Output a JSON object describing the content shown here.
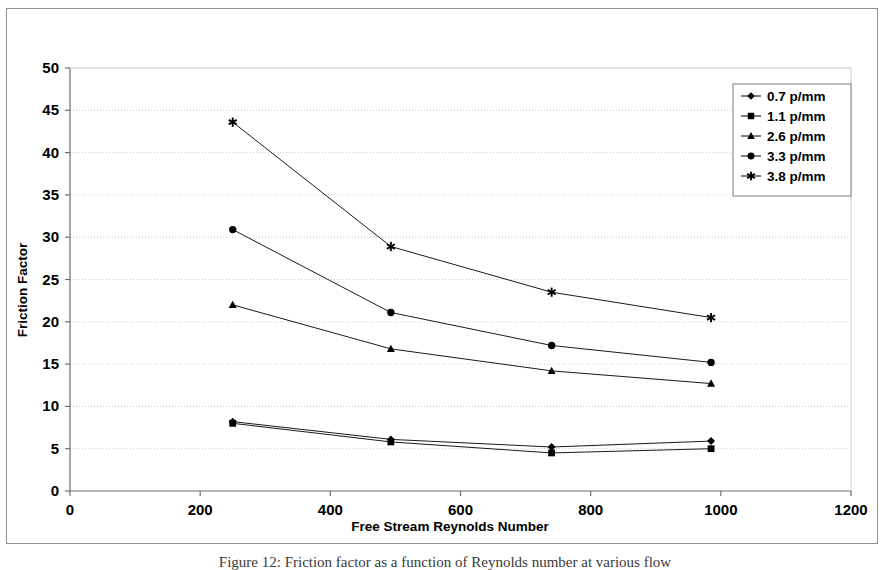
{
  "figure": {
    "caption": "Figure 12:  Friction factor as a function of Reynolds number at various flow"
  },
  "chart_data": {
    "type": "line",
    "title": "",
    "xlabel": "Free Stream Reynolds Number",
    "ylabel": "Friction Factor",
    "xlim": [
      0,
      1200
    ],
    "ylim": [
      0,
      50
    ],
    "xticks": [
      0,
      200,
      400,
      600,
      800,
      1000,
      1200
    ],
    "yticks": [
      0,
      5,
      10,
      15,
      20,
      25,
      30,
      35,
      40,
      45,
      50
    ],
    "grid": "horizontal-dotted",
    "legend_position": "top-right",
    "x": [
      250,
      493,
      740,
      985
    ],
    "series": [
      {
        "name": "0.7 p/mm",
        "marker": "diamond",
        "values": [
          8.2,
          6.1,
          5.2,
          5.9
        ]
      },
      {
        "name": "1.1 p/mm",
        "marker": "square",
        "values": [
          8.0,
          5.8,
          4.5,
          5.0
        ]
      },
      {
        "name": "2.6 p/mm",
        "marker": "triangle",
        "values": [
          22.0,
          16.8,
          14.2,
          12.7
        ]
      },
      {
        "name": "3.3 p/mm",
        "marker": "circle",
        "values": [
          30.9,
          21.1,
          17.2,
          15.2
        ]
      },
      {
        "name": "3.8 p/mm",
        "marker": "star",
        "values": [
          43.6,
          28.9,
          23.5,
          20.5
        ]
      }
    ]
  },
  "axis": {
    "x_tick_labels": [
      "0",
      "200",
      "400",
      "600",
      "800",
      "1000",
      "1200"
    ],
    "y_tick_labels": [
      "0",
      "5",
      "10",
      "15",
      "20",
      "25",
      "30",
      "35",
      "40",
      "45",
      "50"
    ],
    "x_title": "Free Stream Reynolds Number",
    "y_title": "Friction Factor"
  },
  "legend": {
    "items": [
      {
        "label": "0.7 p/mm",
        "marker": "diamond"
      },
      {
        "label": "1.1 p/mm",
        "marker": "square"
      },
      {
        "label": "2.6 p/mm",
        "marker": "triangle"
      },
      {
        "label": "3.3 p/mm",
        "marker": "circle"
      },
      {
        "label": "3.8 p/mm",
        "marker": "star"
      }
    ]
  },
  "colors": {
    "series": "#000000",
    "grid": "#c9c9c9",
    "axis": "#6e6e6e",
    "frame": "#8f8f8f",
    "background": "#ffffff"
  }
}
